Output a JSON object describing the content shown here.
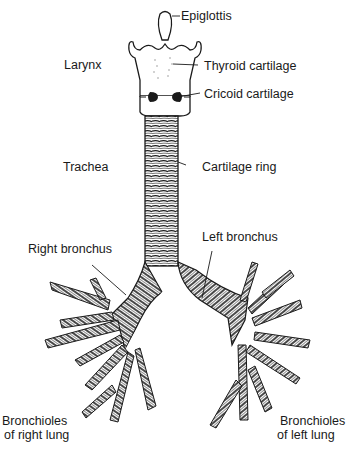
{
  "figure": {
    "labels": {
      "epiglottis": "Epiglottis",
      "larynx": "Larynx",
      "thyroid_cartilage": "Thyroid cartilage",
      "cricoid_cartilage": "Cricoid cartilage",
      "trachea": "Trachea",
      "cartilage_ring": "Cartilage ring",
      "right_bronchus": "Right bronchus",
      "left_bronchus": "Left bronchus",
      "bronchioles_right_line1": "Bronchioles",
      "bronchioles_right_line2": "of right lung",
      "bronchioles_left_line1": "Bronchioles",
      "bronchioles_left_line2": "of left lung"
    },
    "colors": {
      "ink": "#1a1a1a",
      "background": "#ffffff"
    }
  }
}
